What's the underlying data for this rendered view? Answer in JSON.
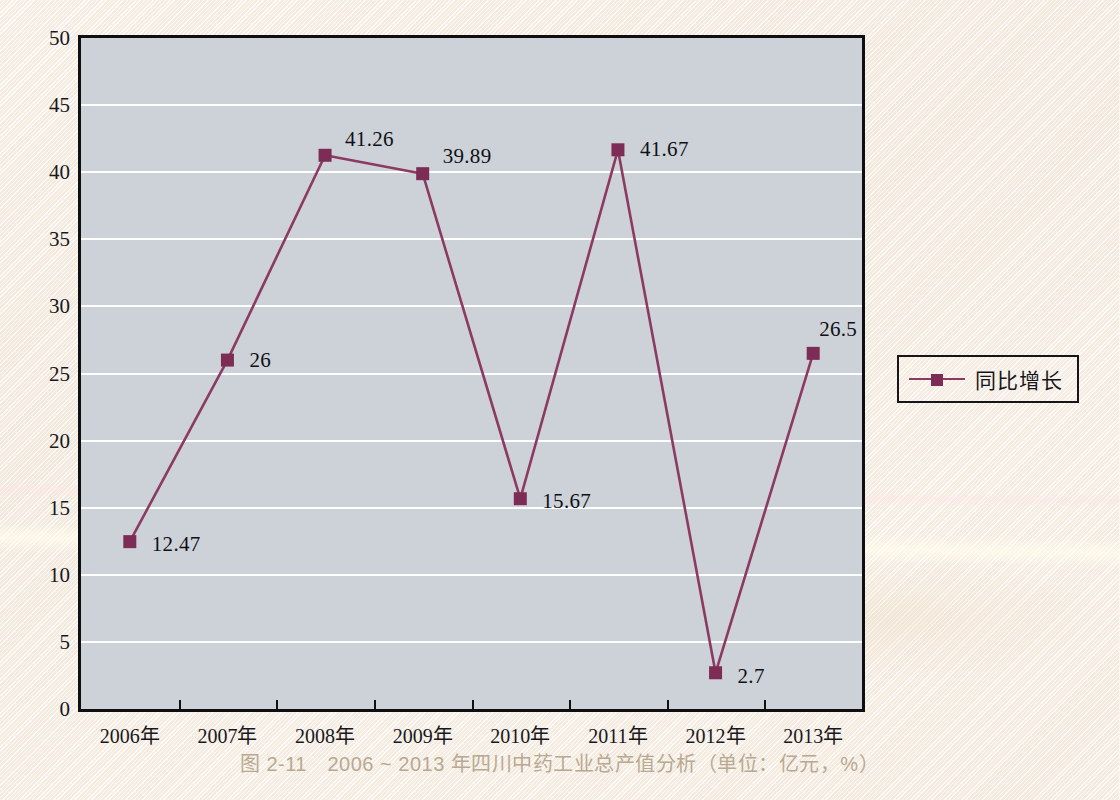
{
  "caption": "图 2-11　2006 ~ 2013 年四川中药工业总产值分析（单位：亿元，%）",
  "legend": {
    "label": "同比增长",
    "marker_icon": "square-marker-icon",
    "line_color": "#7d2d55"
  },
  "colors": {
    "series": "#7d2d55",
    "line": "#8c3a63",
    "plot_background": "#ccd2d8",
    "gridline": "#ffffff",
    "axis": "#0f0f11",
    "paper": "#fbf5ee",
    "caption_text": "#b9a991",
    "tick_text": "#18181c"
  },
  "chart_data": {
    "type": "line",
    "title": "",
    "subtitle": "",
    "xlabel": "",
    "ylabel": "",
    "ylim": [
      0,
      50
    ],
    "ytick_interval": 5,
    "yticks": [
      "0",
      "5",
      "10",
      "15",
      "20",
      "25",
      "30",
      "35",
      "40",
      "45",
      "50"
    ],
    "ytick_values": [
      0,
      5,
      10,
      15,
      20,
      25,
      30,
      35,
      40,
      45,
      50
    ],
    "grid": true,
    "grid_axis": "y",
    "legend_position": "right",
    "categories": [
      "2006年",
      "2007年",
      "2008年",
      "2009年",
      "2010年",
      "2011年",
      "2012年",
      "2013年"
    ],
    "series": [
      {
        "name": "同比增长",
        "values": [
          12.47,
          26,
          41.26,
          39.89,
          15.67,
          41.67,
          2.7,
          26.5
        ],
        "point_labels": [
          "12.47",
          "26",
          "41.26",
          "39.89",
          "15.67",
          "41.67",
          "2.7",
          "26.5"
        ],
        "marker": "square",
        "color": "#7d2d55"
      }
    ],
    "label_offsets": [
      {
        "dx": 22,
        "dy": 2
      },
      {
        "dx": 22,
        "dy": 0
      },
      {
        "dx": 20,
        "dy": -16
      },
      {
        "dx": 20,
        "dy": -18
      },
      {
        "dx": 22,
        "dy": 2
      },
      {
        "dx": 22,
        "dy": -1
      },
      {
        "dx": 22,
        "dy": 3
      },
      {
        "dx": 6,
        "dy": -24
      }
    ]
  }
}
